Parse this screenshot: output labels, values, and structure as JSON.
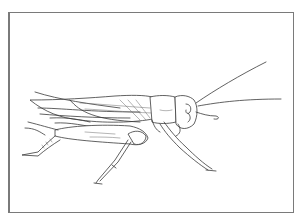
{
  "illustration": {
    "subject": "cricket",
    "style": "line drawing",
    "colors": {
      "background": "#ffffff",
      "ink": "#3a3a3a",
      "frame": "#7a7a7a"
    }
  }
}
